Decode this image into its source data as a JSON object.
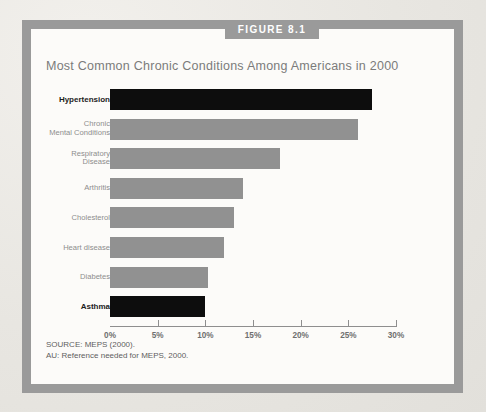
{
  "figure": {
    "band_label": "FIGURE 8.1",
    "band_color": "#9a9a9a",
    "frame_color": "#9a9a9a"
  },
  "source_notes": [
    "SOURCE: MEPS (2000).",
    "AU: Reference needed for MEPS, 2000."
  ],
  "colors": {
    "bar_gray": "#919191",
    "bar_dark": "#0d0d0d",
    "axis": "#8e8e8e",
    "title_text": "#7b7b7b",
    "label_text": "#8d8d8d",
    "label_text_emphasis": "#1c1c1c",
    "page_background": "#e9e7e3",
    "panel_background": "#fcfbf9"
  },
  "chart_data": {
    "type": "bar",
    "orientation": "horizontal",
    "title": "Most Common Chronic Conditions Among Americans in 2000",
    "xlabel": "",
    "ylabel": "",
    "xlim": [
      0,
      30
    ],
    "grid": false,
    "legend": null,
    "tick_labels": [
      "0%",
      "5%",
      "10%",
      "15%",
      "20%",
      "25%",
      "30%"
    ],
    "tick_values": [
      0,
      5,
      10,
      15,
      20,
      25,
      30
    ],
    "categories": [
      "Hypertension",
      "Chronic\nMental Conditions",
      "Respiratory\nDisease",
      "Arthritis",
      "Cholesterol",
      "Heart disease",
      "Diabetes",
      "Asthma"
    ],
    "values": [
      27.5,
      26.0,
      17.8,
      14.0,
      13.0,
      12.0,
      10.3,
      10.0
    ],
    "bar_colors": [
      "#0d0d0d",
      "#919191",
      "#919191",
      "#919191",
      "#919191",
      "#919191",
      "#919191",
      "#0d0d0d"
    ],
    "emphasized": [
      true,
      false,
      false,
      false,
      false,
      false,
      false,
      true
    ]
  }
}
